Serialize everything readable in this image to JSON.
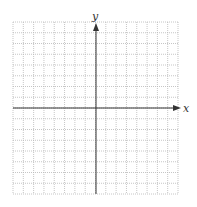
{
  "graph": {
    "type": "blank coordinate grid",
    "x_axis_label": "x",
    "y_axis_label": "y",
    "grid": {
      "columns": 16,
      "rows": 16,
      "style": "dotted"
    },
    "colors": {
      "axis": "#333333",
      "grid": "#b8b8b8",
      "background": "#ffffff"
    }
  }
}
